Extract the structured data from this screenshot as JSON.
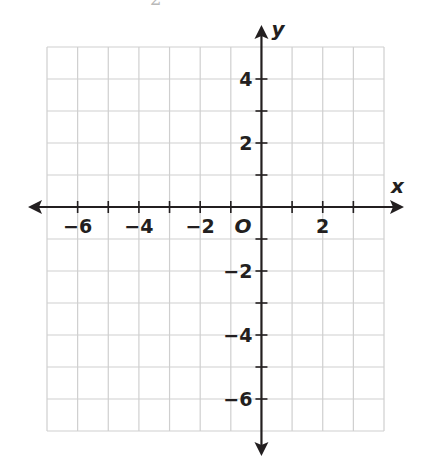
{
  "cropped_header_fragment": "2",
  "chart_data": {
    "type": "scatter",
    "title": "",
    "subtitle": "",
    "xlabel": "x",
    "ylabel": "y",
    "origin_label": "O",
    "xlim": [
      -7,
      4
    ],
    "ylim": [
      -7,
      5
    ],
    "grid": true,
    "grid_step": 1,
    "x_ticks": [
      -6,
      -5,
      -4,
      -3,
      -2,
      -1,
      1,
      2,
      3
    ],
    "y_ticks": [
      -6,
      -5,
      -4,
      -3,
      -2,
      -1,
      1,
      2,
      3,
      4
    ],
    "x_tick_labels": [
      "−6",
      "−4",
      "−2",
      "2"
    ],
    "y_tick_labels": [
      "4",
      "2",
      "−2",
      "−4",
      "−6"
    ],
    "series": [],
    "legend": null
  },
  "colors": {
    "axis": "#231f20",
    "grid": "#cfcfcf",
    "background": "#ffffff"
  }
}
